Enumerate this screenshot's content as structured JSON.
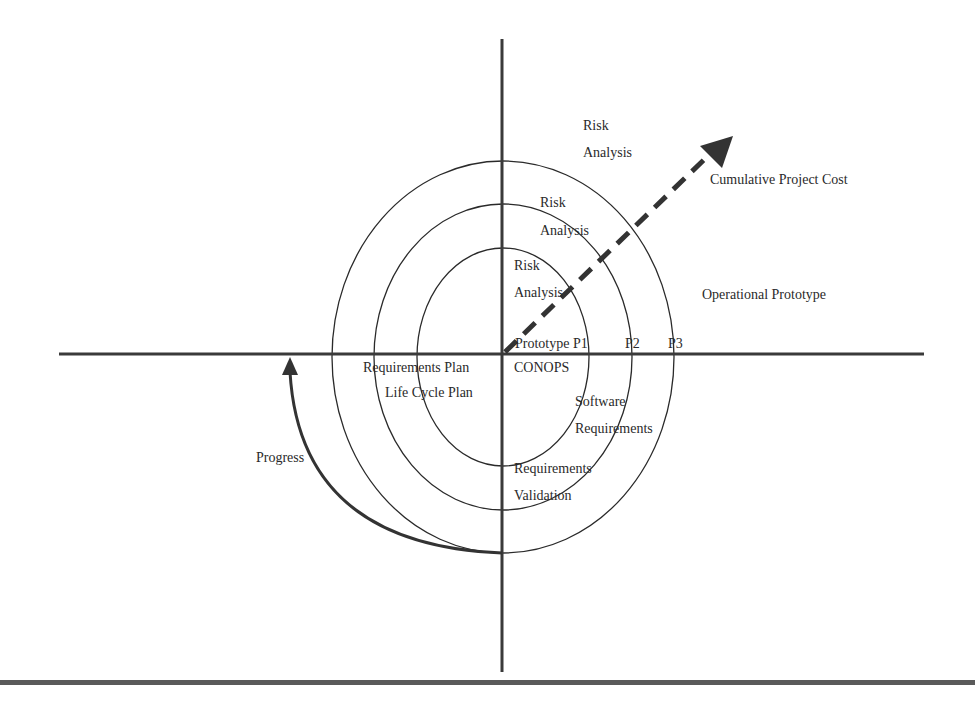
{
  "diagram": {
    "type": "spiral-model",
    "colors": {
      "line": "#2a2a2a",
      "text": "#2a2a2a",
      "rule": "#5a5a5a",
      "background": "#ffffff"
    },
    "labels": {
      "risk_outer_1": "Risk",
      "risk_outer_2": "Analysis",
      "risk_middle_1": "Risk",
      "risk_middle_2": "Analysis",
      "risk_inner_1": "Risk",
      "risk_inner_2": "Analysis",
      "cumulative_cost": "Cumulative Project Cost",
      "operational_prototype": "Operational Prototype",
      "prototype_p1": "Prototype P1",
      "p2": "P2",
      "p3": "P3",
      "requirements_plan": "Requirements Plan",
      "life_cycle_plan": "Life Cycle Plan",
      "conops": "CONOPS",
      "software": "Software",
      "software_requirements": "Requirements",
      "requirements_validation_1": "Requirements",
      "requirements_validation_2": "Validation",
      "progress": "Progress"
    }
  }
}
